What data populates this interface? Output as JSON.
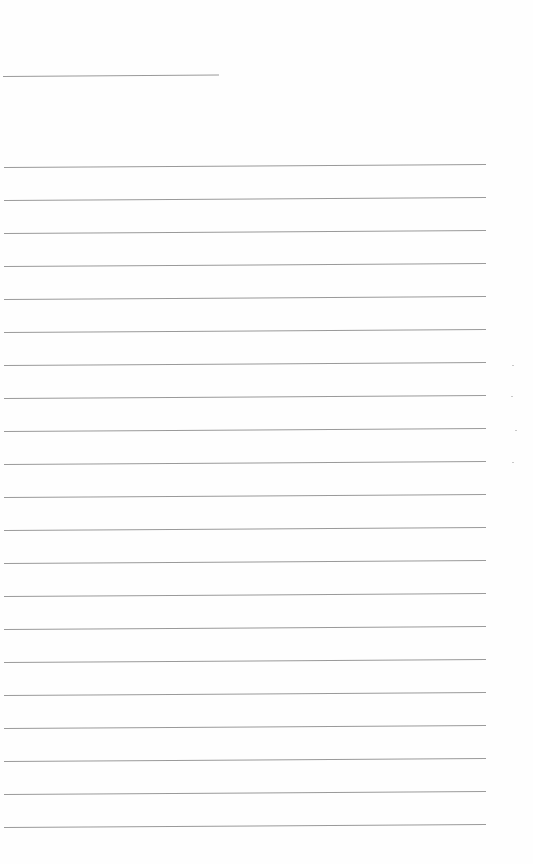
{
  "page": {
    "type": "blank lined sheet",
    "background": "#fefefe",
    "line_color": "#9a9a9a",
    "header_line": {
      "y": 76,
      "x_start": 3,
      "x_end": 219
    },
    "ruled_lines": {
      "count": 21,
      "first_y": 167,
      "spacing": 33,
      "x_start": 4,
      "x_end": 486
    }
  }
}
